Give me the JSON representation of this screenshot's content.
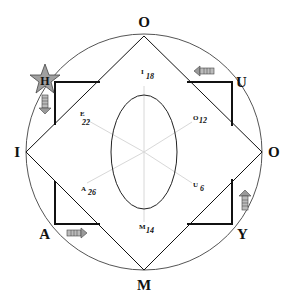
{
  "diagram": {
    "outer_labels": {
      "top": "O",
      "right": "O",
      "bottom": "M",
      "left": "I",
      "top_left": "H",
      "top_right": "U",
      "bottom_left": "A",
      "bottom_right": "Y"
    },
    "inner_labels": [
      {
        "letter": "I",
        "value": "18"
      },
      {
        "letter": "O",
        "value": "12"
      },
      {
        "letter": "U",
        "value": "6"
      },
      {
        "letter": "M",
        "value": "14"
      },
      {
        "letter": "A",
        "value": "26"
      },
      {
        "letter": "E",
        "value": "22"
      }
    ],
    "icons": {
      "star": "star-icon",
      "arrow_h": "arrow-down-icon",
      "arrow_u": "arrow-left-icon",
      "arrow_a": "arrow-right-icon",
      "arrow_y": "arrow-up-icon"
    },
    "colors": {
      "line": "#111111",
      "spoke": "#d8d8d8",
      "arrow_fill": "#9a9a9a",
      "star_fill": "#a0a0a0"
    }
  }
}
